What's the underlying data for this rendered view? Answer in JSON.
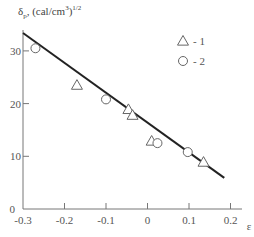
{
  "chart_data": {
    "type": "scatter",
    "xlabel": "ε",
    "ylabel": "δp, (cal/cm³)^1/2",
    "xlim": [
      -0.3,
      0.22
    ],
    "ylim": [
      0,
      34
    ],
    "xticks": [
      -0.3,
      -0.2,
      -0.1,
      0,
      0.1,
      0.2
    ],
    "xtick_labels": [
      "-0.3",
      "-0.2",
      "-0.1",
      "0",
      "0.1",
      "0.2"
    ],
    "yticks": [
      0,
      10,
      20,
      30
    ],
    "ytick_labels": [
      "0",
      "10",
      "20",
      "30"
    ],
    "grid": false,
    "legend_position": "upper right",
    "series": [
      {
        "name": "1",
        "marker": "triangle",
        "points": [
          {
            "x": -0.17,
            "y": 23.5
          },
          {
            "x": -0.046,
            "y": 18.9
          },
          {
            "x": -0.036,
            "y": 17.8
          },
          {
            "x": 0.01,
            "y": 12.9
          },
          {
            "x": 0.135,
            "y": 8.9
          }
        ]
      },
      {
        "name": "2",
        "marker": "circle",
        "points": [
          {
            "x": -0.27,
            "y": 30.5
          },
          {
            "x": -0.1,
            "y": 20.8
          },
          {
            "x": 0.024,
            "y": 12.5
          },
          {
            "x": 0.097,
            "y": 10.8
          }
        ]
      }
    ],
    "fit_line": {
      "x": [
        -0.3,
        0.185
      ],
      "y": [
        33.4,
        5.9
      ]
    }
  },
  "labels": {
    "title_main": "δ",
    "title_sub": "p",
    "title_unit": ", (cal/cm",
    "title_sup3": "3",
    "title_close": ")",
    "title_sup": "1/2",
    "legend_1": "- 1",
    "legend_2": "- 2",
    "xlabel": "ε"
  }
}
